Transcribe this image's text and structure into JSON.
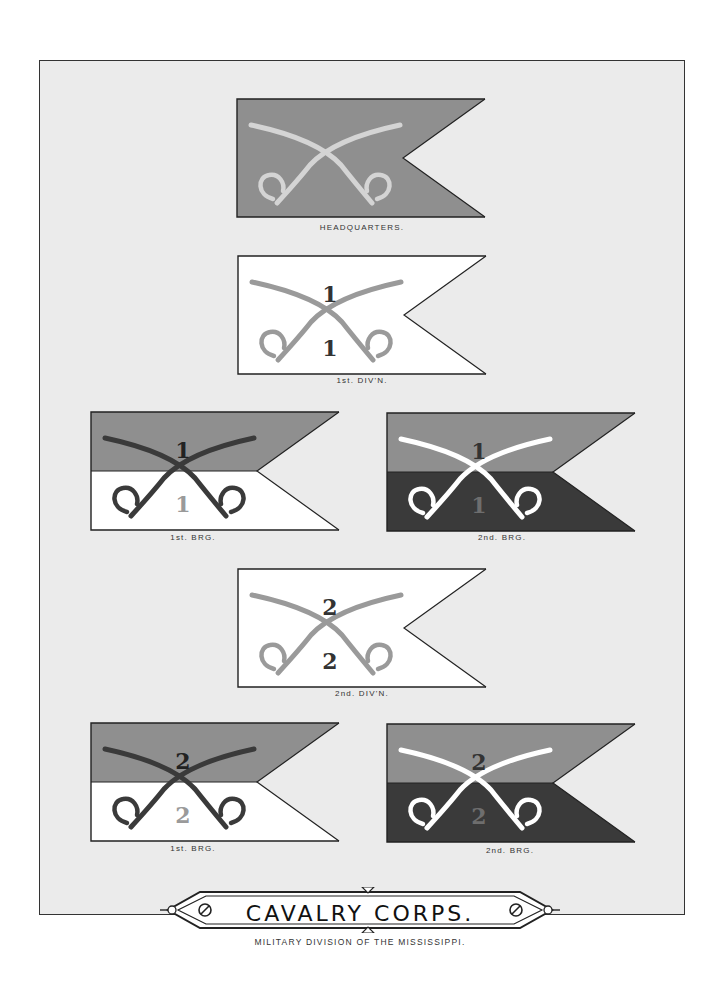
{
  "plate": {
    "title": "CAVALRY CORPS.",
    "subtitle": "MILITARY DIVISION OF THE MISSISSIPPI."
  },
  "colors": {
    "page_bg": "#ebebeb",
    "grey": "#8f8f8f",
    "dark": "#3a3a3a",
    "white": "#ffffff",
    "light_saber": "#d4d4d4",
    "mid_saber": "#9a9a9a",
    "dark_numeral": "#333333"
  },
  "flags": [
    {
      "id": "headquarters",
      "caption": "HEADQUARTERS.",
      "top_color": "#8f8f8f",
      "bottom_color": "#8f8f8f",
      "saber_color": "#d4d4d4",
      "numeral_top": "",
      "numeral_bottom": ""
    },
    {
      "id": "1st-div",
      "caption": "1st. DIV'N.",
      "top_color": "#ffffff",
      "bottom_color": "#ffffff",
      "saber_color": "#9a9a9a",
      "numeral_top": "1",
      "numeral_bottom": "1"
    },
    {
      "id": "1st-div-1st-brg",
      "caption": "1st. BRG.",
      "top_color": "#8f8f8f",
      "bottom_color": "#ffffff",
      "saber_color": "#3a3a3a",
      "numeral_top": "1",
      "numeral_bottom": "1"
    },
    {
      "id": "1st-div-2nd-brg",
      "caption": "2nd. BRG.",
      "top_color": "#8f8f8f",
      "bottom_color": "#3a3a3a",
      "saber_color": "#ffffff",
      "numeral_top": "1",
      "numeral_bottom": "1"
    },
    {
      "id": "2nd-div",
      "caption": "2nd. DIV'N.",
      "top_color": "#ffffff",
      "bottom_color": "#ffffff",
      "saber_color": "#9a9a9a",
      "numeral_top": "2",
      "numeral_bottom": "2"
    },
    {
      "id": "2nd-div-1st-brg",
      "caption": "1st. BRG.",
      "top_color": "#8f8f8f",
      "bottom_color": "#ffffff",
      "saber_color": "#3a3a3a",
      "numeral_top": "2",
      "numeral_bottom": "2"
    },
    {
      "id": "2nd-div-2nd-brg",
      "caption": "2nd. BRG.",
      "top_color": "#8f8f8f",
      "bottom_color": "#3a3a3a",
      "saber_color": "#ffffff",
      "numeral_top": "2",
      "numeral_bottom": "2"
    }
  ]
}
